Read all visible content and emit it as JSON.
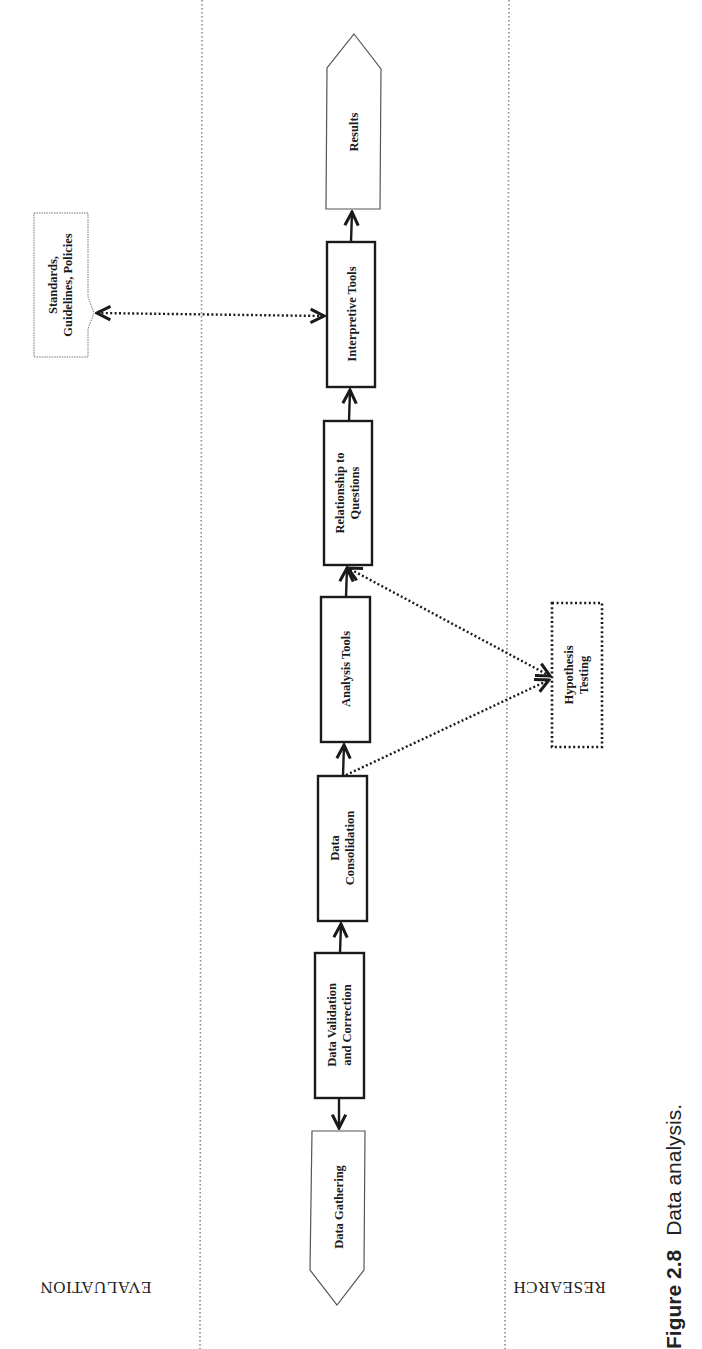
{
  "diagram": {
    "orientation": "page rotated 90 degrees counter-clockwise",
    "lanes": {
      "left_label": "EVALUATION",
      "right_label": "RESEARCH"
    },
    "nodes": {
      "results": "Results",
      "interpretive_tools": "Interpretive Tools",
      "relationship_line1": "Relationship to",
      "relationship_line2": "Questions",
      "analysis_tools": "Analysis Tools",
      "consolidation_line1": "Data",
      "consolidation_line2": "Consolidation",
      "validation_line1": "Data Validation",
      "validation_line2": "and Correction",
      "data_gathering": "Data Gathering",
      "standards_line1": "Standards,",
      "standards_line2": "Guidelines, Policies",
      "hypothesis_line1": "Hypothesis",
      "hypothesis_line2": "Testing"
    },
    "flow": [
      "Data Gathering",
      "Data Validation and Correction",
      "Data Consolidation",
      "Analysis Tools",
      "Relationship to Questions",
      "Interpretive Tools",
      "Results"
    ],
    "connections": [
      {
        "from": "Data Validation and Correction",
        "to": "Data Gathering",
        "style": "solid"
      },
      {
        "from": "Data Validation and Correction",
        "to": "Data Consolidation",
        "style": "solid"
      },
      {
        "from": "Data Consolidation",
        "to": "Analysis Tools",
        "style": "solid"
      },
      {
        "from": "Analysis Tools",
        "to": "Relationship to Questions",
        "style": "solid"
      },
      {
        "from": "Relationship to Questions",
        "to": "Interpretive Tools",
        "style": "solid"
      },
      {
        "from": "Interpretive Tools",
        "to": "Results",
        "style": "solid"
      },
      {
        "from": "Standards, Guidelines, Policies",
        "to": "Interpretive Tools",
        "style": "dotted",
        "bidirectional": true
      },
      {
        "from": "Data Consolidation",
        "to": "Hypothesis Testing",
        "style": "dotted"
      },
      {
        "from": "Hypothesis Testing",
        "to": "Relationship to Questions",
        "style": "dotted",
        "bidirectional": true
      }
    ],
    "colors": {
      "stroke": "#1a1a1a",
      "light_stroke": "#555555",
      "lane_divider": "#8a8a8a",
      "background": "#ffffff"
    }
  },
  "caption": {
    "figure_number": "Figure 2.8",
    "text": "Data analysis."
  }
}
